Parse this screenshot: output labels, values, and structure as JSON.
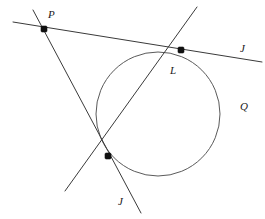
{
  "figure": {
    "width": 265,
    "height": 219,
    "background_color": "#ffffff",
    "stroke_color": "#3a3a3a",
    "circle_stroke_color": "#5a5a5a",
    "point_color": "#111111",
    "label_color": "#1a1a1a"
  },
  "labels": {
    "point_p": "P",
    "point_l": "L",
    "line_j_right": "J",
    "line_j_bottom": "J",
    "circle_q": "Q"
  },
  "geometry": {
    "circle": {
      "name": "Q",
      "center_x": 158,
      "center_y": 114,
      "radius": 62
    },
    "points": [
      {
        "name": "P",
        "x": 44,
        "y": 29,
        "role": "external-intersection"
      },
      {
        "name": "L",
        "x": 181,
        "y": 50,
        "role": "upper-tangent-point"
      },
      {
        "name": "",
        "x": 108,
        "y": 156,
        "role": "lower-tangent-point"
      }
    ],
    "lines": [
      {
        "name": "J-upper-tangent",
        "x1": 13,
        "y1": 22,
        "x2": 262,
        "y2": 62
      },
      {
        "name": "J-lower-tangent",
        "x1": 33,
        "y1": 10,
        "x2": 141,
        "y2": 213
      },
      {
        "name": "secant-through-tangent-points",
        "x1": 65,
        "y1": 191,
        "x2": 197,
        "y2": 7
      }
    ]
  }
}
